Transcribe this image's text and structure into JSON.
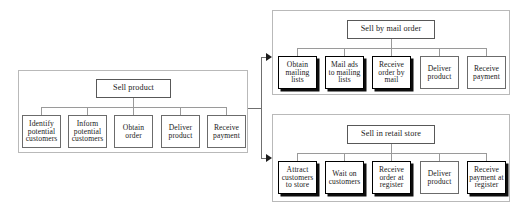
{
  "diagram": {
    "panels": [
      {
        "id": "sell-product",
        "root": {
          "label": "Sell product"
        },
        "leaves": [
          {
            "label": "Identify potential customers",
            "emphasized": false
          },
          {
            "label": "Inform potential customers",
            "emphasized": false
          },
          {
            "label": "Obtain order",
            "emphasized": false
          },
          {
            "label": "Deliver product",
            "emphasized": false
          },
          {
            "label": "Receive payment",
            "emphasized": false
          }
        ]
      },
      {
        "id": "sell-by-mail-order",
        "root": {
          "label": "Sell by mail order"
        },
        "leaves": [
          {
            "label": "Obtain mailing lists",
            "emphasized": true
          },
          {
            "label": "Mail ads to mailing lists",
            "emphasized": true
          },
          {
            "label": "Receive order by mail",
            "emphasized": true
          },
          {
            "label": "Deliver product",
            "emphasized": false
          },
          {
            "label": "Receive payment",
            "emphasized": false
          }
        ]
      },
      {
        "id": "sell-in-retail-store",
        "root": {
          "label": "Sell in retail store"
        },
        "leaves": [
          {
            "label": "Attract customers to store",
            "emphasized": true
          },
          {
            "label": "Wait on customers",
            "emphasized": true
          },
          {
            "label": "Receive order at register",
            "emphasized": true
          },
          {
            "label": "Deliver product",
            "emphasized": false
          },
          {
            "label": "Receive payment at register",
            "emphasized": true
          }
        ]
      }
    ],
    "colors": {
      "panel_border": "#b9b9b9",
      "node_border": "#6b6b6b",
      "emphasized_border": "#000000",
      "connector": "#9a9a9a",
      "arrow": "#1c1c1c",
      "text": "#1a1a1a",
      "background": "#ffffff"
    }
  }
}
